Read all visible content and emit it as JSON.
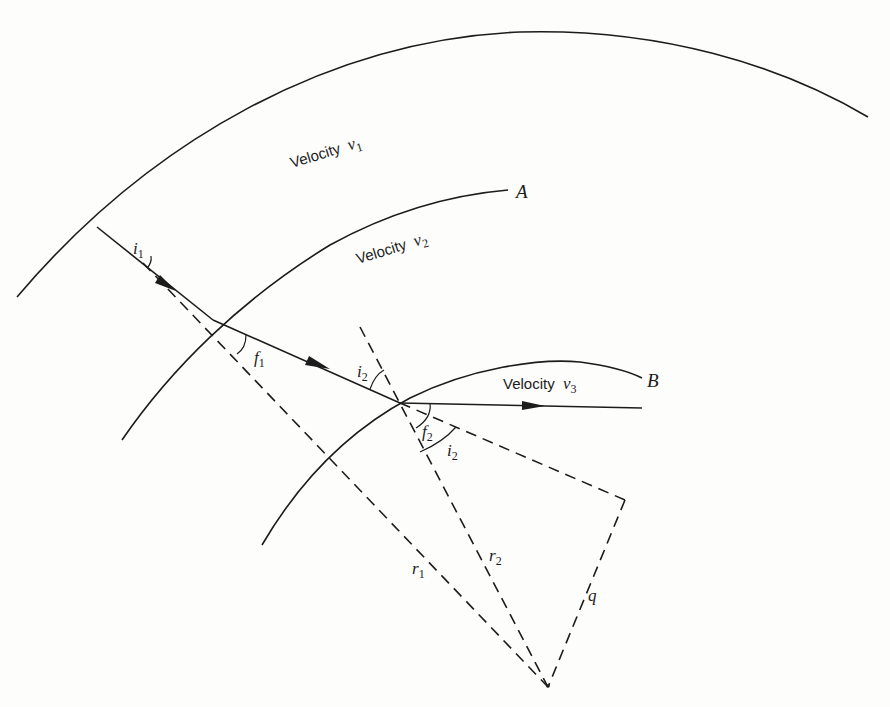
{
  "figure": {
    "layers": [
      {
        "label": "Velocity",
        "symbol": "v",
        "subscript": "1"
      },
      {
        "label": "Velocity",
        "symbol": "v",
        "subscript": "2"
      },
      {
        "label": "Velocity",
        "symbol": "v",
        "subscript": "3"
      }
    ],
    "boundaries": {
      "a": {
        "label": "A"
      },
      "b": {
        "label": "B"
      }
    },
    "angles": {
      "i1": {
        "symbol": "i",
        "subscript": "1"
      },
      "f1": {
        "symbol": "f",
        "subscript": "1"
      },
      "i2_incidence": {
        "symbol": "i",
        "subscript": "2"
      },
      "f2": {
        "symbol": "f",
        "subscript": "2"
      },
      "i2_lower": {
        "symbol": "i",
        "subscript": "2"
      }
    },
    "lengths": {
      "r1": {
        "symbol": "r",
        "subscript": "1"
      },
      "r2": {
        "symbol": "r",
        "subscript": "2"
      },
      "q": {
        "symbol": "q"
      }
    },
    "colors": {
      "ink": "#1c1c1c",
      "paper": "#fdfdfc"
    }
  }
}
